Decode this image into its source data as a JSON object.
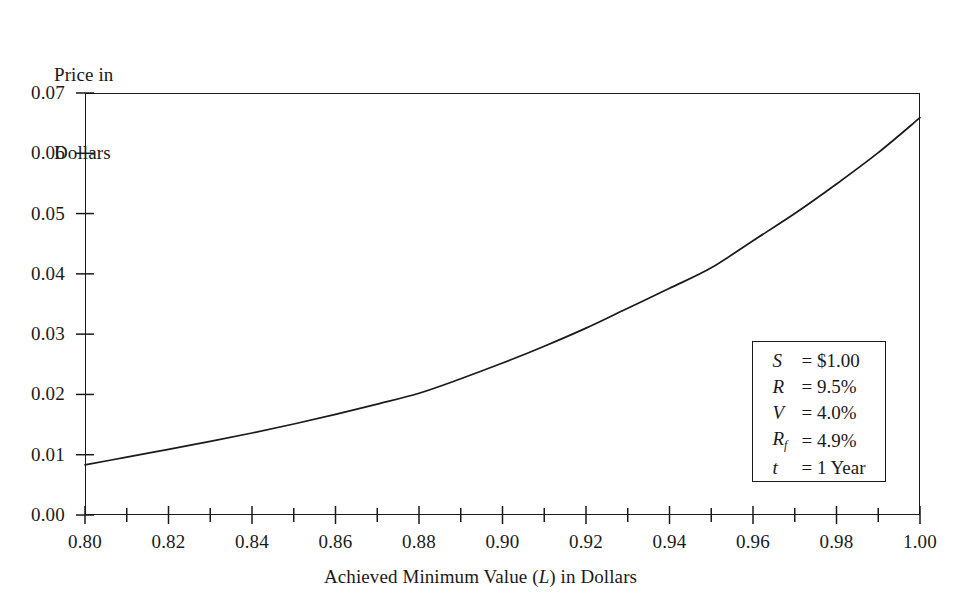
{
  "chart_data": {
    "type": "line",
    "title": "",
    "xlabel": "Achieved Minimum Value (L) in Dollars",
    "xlabel_parts": {
      "pre": "Achieved Minimum Value (",
      "italic": "L",
      "post": ") in Dollars"
    },
    "ylabel": "Price in Dollars",
    "ylabel_line1": "Price in",
    "ylabel_line2": "Dollars",
    "xlim": [
      0.8,
      1.0
    ],
    "ylim": [
      0.0,
      0.07
    ],
    "xticks": [
      0.8,
      0.82,
      0.84,
      0.86,
      0.88,
      0.9,
      0.92,
      0.94,
      0.96,
      0.98,
      1.0
    ],
    "xtick_labels": [
      "0.80",
      "0.82",
      "0.84",
      "0.86",
      "0.88",
      "0.90",
      "0.92",
      "0.94",
      "0.96",
      "0.98",
      "1.00"
    ],
    "x_minor_ticks": [
      0.81,
      0.83,
      0.85,
      0.87,
      0.89,
      0.91,
      0.93,
      0.95,
      0.97,
      0.99
    ],
    "yticks": [
      0.0,
      0.01,
      0.02,
      0.03,
      0.04,
      0.05,
      0.06,
      0.07
    ],
    "ytick_labels": [
      "0.00",
      "0.01",
      "0.02",
      "0.03",
      "0.04",
      "0.05",
      "0.06",
      "0.07"
    ],
    "grid": false,
    "legend_position": "inside-lower-right",
    "series": [
      {
        "name": "Price",
        "x": [
          0.8,
          0.81,
          0.82,
          0.83,
          0.84,
          0.85,
          0.86,
          0.87,
          0.88,
          0.89,
          0.9,
          0.91,
          0.92,
          0.93,
          0.94,
          0.95,
          0.96,
          0.97,
          0.98,
          0.99,
          1.0
        ],
        "y": [
          0.0083,
          0.0096,
          0.0109,
          0.0122,
          0.0136,
          0.0151,
          0.0167,
          0.0184,
          0.0202,
          0.0226,
          0.0252,
          0.028,
          0.031,
          0.0343,
          0.0376,
          0.041,
          0.0455,
          0.05,
          0.0549,
          0.0601,
          0.0659
        ]
      }
    ],
    "line_color": "#1a1a1a",
    "frame_color": "#1a1a1a",
    "background": "#ffffff"
  },
  "legend": {
    "rows": [
      {
        "symbol": "S",
        "subscript": "",
        "equals": "=",
        "value": "$1.00"
      },
      {
        "symbol": "R",
        "subscript": "",
        "equals": "=",
        "value": "9.5%"
      },
      {
        "symbol": "V",
        "subscript": "",
        "equals": "=",
        "value": "4.0%"
      },
      {
        "symbol": "R",
        "subscript": "f",
        "equals": "=",
        "value": "4.9%"
      },
      {
        "symbol": "t",
        "subscript": "",
        "equals": "=",
        "value": "1 Year"
      }
    ]
  }
}
